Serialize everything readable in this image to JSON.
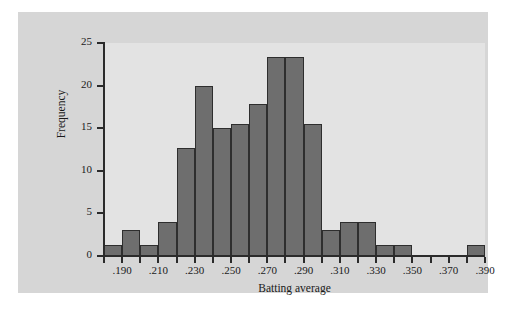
{
  "figure": {
    "background_color": "#d6d6d6",
    "plot_background_color": "#e3e3e3",
    "bar_fill_color": "#6e6e6e",
    "bar_edge_color": "#2e2e2e",
    "axis_color": "#2b2b2b"
  },
  "chart_data": {
    "type": "bar",
    "title": "",
    "xlabel": "Batting average",
    "ylabel": "Frequency",
    "grid": false,
    "legend": null,
    "xlim": [
      0.18,
      0.39
    ],
    "ylim": [
      0,
      25
    ],
    "xticks": [
      ".190",
      ".210",
      ".230",
      ".250",
      ".270",
      ".290",
      ".310",
      ".330",
      ".350",
      ".370",
      ".390"
    ],
    "xtick_values": [
      0.19,
      0.21,
      0.23,
      0.25,
      0.27,
      0.29,
      0.31,
      0.33,
      0.35,
      0.37,
      0.39
    ],
    "yticks": [
      "0",
      "5",
      "10",
      "15",
      "20",
      "25"
    ],
    "ytick_values": [
      0,
      5,
      10,
      15,
      20,
      25
    ],
    "bin_width": 0.01,
    "bin_edges": [
      0.18,
      0.19,
      0.2,
      0.21,
      0.22,
      0.23,
      0.24,
      0.25,
      0.26,
      0.27,
      0.28,
      0.29,
      0.3,
      0.31,
      0.32,
      0.33,
      0.34,
      0.35,
      0.36,
      0.37,
      0.38,
      0.39
    ],
    "categories": [
      "0.180-0.190",
      "0.190-0.200",
      "0.200-0.210",
      "0.210-0.220",
      "0.220-0.230",
      "0.230-0.240",
      "0.240-0.250",
      "0.250-0.260",
      "0.260-0.270",
      "0.270-0.280",
      "0.280-0.290",
      "0.290-0.300",
      "0.300-0.310",
      "0.310-0.320",
      "0.320-0.330",
      "0.330-0.340",
      "0.340-0.350",
      "0.350-0.360",
      "0.360-0.370",
      "0.370-0.380",
      "0.380-0.390"
    ],
    "values": [
      1.3,
      3,
      1.3,
      4,
      12.7,
      20,
      15,
      15.5,
      17.8,
      23.3,
      23.3,
      15.5,
      3,
      4,
      4,
      1.3,
      1.3,
      0,
      0,
      0,
      1.3
    ]
  }
}
